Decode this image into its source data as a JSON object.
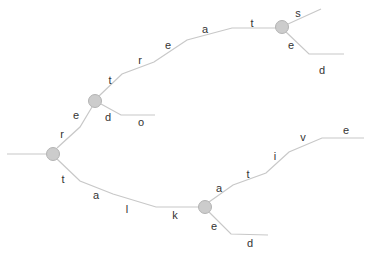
{
  "diagram": {
    "type": "trie",
    "words": [
      "retreats",
      "retreated",
      "redo",
      "talkative",
      "talked"
    ],
    "colors": {
      "edge": "#c8c8c8",
      "node_fill": "#cccccc",
      "node_stroke": "#b3b3b3",
      "label": "#333333"
    },
    "nodes": [
      {
        "id": "n0",
        "cx": 53,
        "cy": 154
      },
      {
        "id": "n1",
        "cx": 95,
        "cy": 101
      },
      {
        "id": "n2",
        "cx": 282,
        "cy": 27
      },
      {
        "id": "n3",
        "cx": 205,
        "cy": 207
      }
    ],
    "edges": [
      {
        "id": "root-in",
        "points": "7,154 46,154"
      },
      {
        "id": "r-e",
        "points": "57,148 80,127 92,107"
      },
      {
        "id": "t-r-e-a-t",
        "points": "99,96 122,74 154,62 187,40 232,28 276,28"
      },
      {
        "id": "s",
        "points": "288,24 321,9"
      },
      {
        "id": "e-d-top",
        "points": "286,32 309,54 344,54"
      },
      {
        "id": "d-o",
        "points": "101,104 121,115 155,115"
      },
      {
        "id": "t-a-l-k",
        "points": "57,159 80,181 113,194 156,207 199,207"
      },
      {
        "id": "a-t-i-v-e",
        "points": "209,202 233,185 266,173 289,152 322,138 364,138"
      },
      {
        "id": "e-d-bottom",
        "points": "209,212 231,234 268,235"
      }
    ],
    "labels": [
      {
        "text": "r",
        "x": 62,
        "y": 138
      },
      {
        "text": "e",
        "x": 76,
        "y": 119
      },
      {
        "text": "t",
        "x": 110,
        "y": 84
      },
      {
        "text": "r",
        "x": 140,
        "y": 64
      },
      {
        "text": "e",
        "x": 168,
        "y": 49
      },
      {
        "text": "a",
        "x": 205,
        "y": 33
      },
      {
        "text": "t",
        "x": 252,
        "y": 27
      },
      {
        "text": "s",
        "x": 298,
        "y": 17
      },
      {
        "text": "e",
        "x": 291,
        "y": 49
      },
      {
        "text": "d",
        "x": 322,
        "y": 74
      },
      {
        "text": "d",
        "x": 108,
        "y": 121
      },
      {
        "text": "o",
        "x": 141,
        "y": 126
      },
      {
        "text": "t",
        "x": 63,
        "y": 183
      },
      {
        "text": "a",
        "x": 96,
        "y": 199
      },
      {
        "text": "l",
        "x": 127,
        "y": 213
      },
      {
        "text": "k",
        "x": 175,
        "y": 219
      },
      {
        "text": "a",
        "x": 219,
        "y": 192
      },
      {
        "text": "t",
        "x": 248,
        "y": 178
      },
      {
        "text": "i",
        "x": 275,
        "y": 160
      },
      {
        "text": "v",
        "x": 303,
        "y": 141
      },
      {
        "text": "e",
        "x": 346,
        "y": 134
      },
      {
        "text": "e",
        "x": 214,
        "y": 230
      },
      {
        "text": "d",
        "x": 250,
        "y": 247
      }
    ]
  }
}
